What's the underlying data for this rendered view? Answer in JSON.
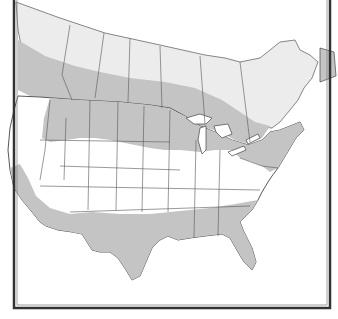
{
  "map": {
    "title": "",
    "region": "North America (United States and southern Canada)",
    "edge_note": "~",
    "colors": {
      "background": "#ffffff",
      "outline": "#444444",
      "frame_outer": "#333333",
      "frame_inner": "#666666",
      "range_primary": "#c4c4c4",
      "range_secondary": "#ececec",
      "out_of_range": "#ffffff"
    },
    "legend": [],
    "zones": [
      {
        "name": "northern-light-band",
        "fill": "range_secondary",
        "description": "Light gray band across northern Canada"
      },
      {
        "name": "canada-southern-belt",
        "fill": "range_primary",
        "description": "Darker gray band across southern Canada and northern US"
      },
      {
        "name": "northern-us-plains",
        "fill": "range_primary",
        "description": "Montana, Wyoming, Dakotas, Minnesota, Wisconsin, Michigan"
      },
      {
        "name": "northeast",
        "fill": "range_primary",
        "description": "New England, New York, Pennsylvania, Maritimes"
      },
      {
        "name": "south",
        "fill": "range_primary",
        "description": "Texas, Oklahoma, Gulf states, Southeast, Carolinas"
      },
      {
        "name": "southwest-coast",
        "fill": "range_primary",
        "description": "California and southern Arizona/New Mexico"
      },
      {
        "name": "central-us-gap",
        "fill": "out_of_range",
        "description": "Central US and Great Basin unshaded"
      }
    ]
  }
}
